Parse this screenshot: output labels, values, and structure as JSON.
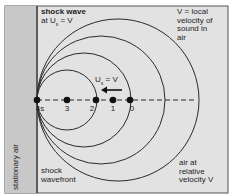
{
  "labels": {
    "shock_wave_title": "shock wave",
    "shock_wave_condition_prefix": "at U",
    "shock_wave_condition_sub": "s",
    "shock_wave_condition_suffix": " = V",
    "velocity_note_line1": "V = local",
    "velocity_note_line2": "velocity of",
    "velocity_note_line3": "sound in",
    "velocity_note_line4": "air",
    "arrow_label_prefix": "U",
    "arrow_label_sub": "s",
    "arrow_label_suffix": " = V",
    "stationary_air": "stationary air",
    "shock_wavefront_line1": "shock",
    "shock_wavefront_line2": "wavefront",
    "air_relative_line1": "air at",
    "air_relative_line2": "relative",
    "air_relative_line3": "velocity V"
  },
  "points": [
    {
      "label": "4s",
      "x": 37
    },
    {
      "label": "3",
      "x": 67
    },
    {
      "label": "2",
      "x": 96
    },
    {
      "label": "1",
      "x": 113
    },
    {
      "label": "0",
      "x": 130
    }
  ],
  "circles": [
    {
      "name": "wave-from-point-3",
      "r": 30
    },
    {
      "name": "wave-from-point-2",
      "r": 47
    },
    {
      "name": "wave-from-point-1",
      "r": 64
    },
    {
      "name": "wave-from-point-0",
      "r": 81
    }
  ],
  "colors": {
    "background": "#e2e2e2",
    "stationary_air_strip": "#c8c8c8",
    "line": "#2a2a2a",
    "frame": "#555555"
  }
}
